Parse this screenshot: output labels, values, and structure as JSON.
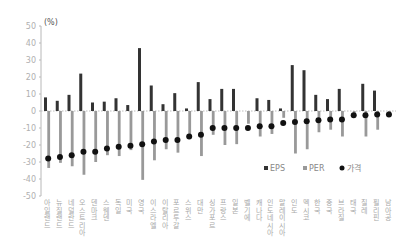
{
  "chart_data": {
    "type": "bar",
    "title": "",
    "unit_label": "(%)",
    "xlabel": "",
    "ylabel": "(%)",
    "ylim": [
      -50,
      50
    ],
    "yticks": [
      50,
      40,
      30,
      20,
      10,
      0,
      -10,
      -20,
      -30,
      -40,
      -50
    ],
    "grid": false,
    "legend_position": "lower-right-inside",
    "categories": [
      "아일랜드",
      "뉴질랜드",
      "네덜란드",
      "오스트리아",
      "덴마크",
      "스웨덴",
      "독일",
      "미국",
      "영국",
      "이스라엘",
      "이탈리아",
      "포르투갈",
      "스위스",
      "대만",
      "싱가포르",
      "프랑스",
      "일본",
      "벨기에",
      "캐나다",
      "인도네시아",
      "말레이시아",
      "인도",
      "멕시코",
      "한국",
      "중국",
      "브라질",
      "태국",
      "칠레",
      "필리핀",
      "남아공"
    ],
    "series": [
      {
        "name": "EPS",
        "kind": "bar",
        "color": "#333333",
        "values": [
          8,
          6,
          9.5,
          22,
          5,
          5.5,
          7.5,
          3.5,
          37,
          15,
          4,
          10.5,
          1.5,
          17,
          7,
          13,
          13,
          0,
          7.5,
          6.5,
          1.5,
          27,
          24,
          9.5,
          7,
          13,
          0,
          16,
          12,
          0
        ]
      },
      {
        "name": "PER",
        "kind": "bar",
        "color": "#999999",
        "values": [
          -33.5,
          -30.5,
          -32.5,
          -37.5,
          -30,
          -26,
          -26.5,
          -23,
          -40.5,
          -29,
          -22.5,
          -24.5,
          -16.5,
          -26.5,
          -14,
          -20,
          -19.5,
          -7.5,
          -15,
          -13.5,
          -4,
          -25,
          -22.5,
          -12.5,
          -11,
          -15,
          -2.5,
          -15,
          -11,
          -2
        ]
      },
      {
        "name": "가격",
        "kind": "dot",
        "color": "#111111",
        "values": [
          -28,
          -27,
          -26,
          -24,
          -24,
          -22,
          -21,
          -20.5,
          -19.5,
          -18,
          -17,
          -17,
          -15,
          -14,
          -10,
          -10,
          -10,
          -10,
          -9,
          -9,
          -7,
          -6.5,
          -6,
          -5.5,
          -5,
          -5,
          -2.5,
          -2.5,
          -2,
          -2
        ]
      }
    ]
  },
  "legend": {
    "items": [
      {
        "label": "EPS",
        "color": "#333333",
        "shape": "square"
      },
      {
        "label": "PER",
        "color": "#999999",
        "shape": "square"
      },
      {
        "label": "가격",
        "color": "#111111",
        "shape": "circle"
      }
    ]
  }
}
